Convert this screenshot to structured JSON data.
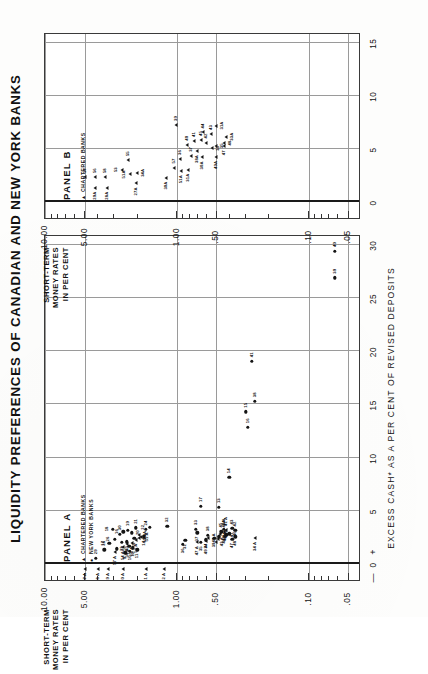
{
  "figure": {
    "title": "LIQUIDITY PREFERENCES OF CANADIAN AND NEW YORK BANKS",
    "y_axis_title_line1": "SHORT-TERM",
    "y_axis_title_line2": "MONEY RATES",
    "y_axis_title_line3": "IN PER CENT",
    "x_axis_title": "EXCESS CASH* AS A PER CENT OF REVISED DEPOSITS",
    "zero_minus": "—",
    "zero_value": "0",
    "zero_plus": "+"
  },
  "chart_data": {
    "type": "scatter",
    "title": "LIQUIDITY PREFERENCES OF CANADIAN AND NEW YORK BANKS",
    "xlabel": "EXCESS CASH* AS A PER CENT OF REVISED DEPOSITS",
    "ylabel": "SHORT-TERM MONEY RATES IN PER CENT",
    "yscale": "log",
    "ylim": [
      0.04,
      10.0
    ],
    "grid": true,
    "legend_position": "inside-top-left",
    "y_ticks": [
      "10.00",
      "5.00",
      "1.00",
      ".50",
      ".10",
      ".05"
    ],
    "y_tick_values": [
      10.0,
      5.0,
      1.0,
      0.5,
      0.1,
      0.05
    ],
    "panels": [
      {
        "name": "PANEL A",
        "label": "PANEL A",
        "xlim": [
          -1.5,
          31
        ],
        "x_ticks": [
          "0",
          "5",
          "10",
          "15",
          "20",
          "25",
          "30"
        ],
        "x_tick_values": [
          0,
          5,
          10,
          15,
          20,
          25,
          30
        ],
        "legend": [
          {
            "symbol": "triangle",
            "label": "CHARTERED BANKS"
          },
          {
            "symbol": "circle",
            "label": "NEW YORK BANKS"
          }
        ],
        "series": [
          {
            "name": "NEW YORK BANKS",
            "marker": "circle",
            "points": [
              {
                "label": "29",
                "x": 0.55,
                "y": 4.1,
                "lp": "r"
              },
              {
                "label": "28",
                "x": 1.35,
                "y": 3.55,
                "lp": "r"
              },
              {
                "label": "27",
                "x": 1.45,
                "y": 2.85,
                "lp": "b"
              },
              {
                "label": "17",
                "x": 1.95,
                "y": 3.25,
                "lp": "t"
              },
              {
                "label": "26",
                "x": 2.35,
                "y": 2.95,
                "lp": "t"
              },
              {
                "label": "30",
                "x": 2.8,
                "y": 2.7,
                "lp": "r"
              },
              {
                "label": "18",
                "x": 3.3,
                "y": 3.05,
                "lp": "t"
              },
              {
                "label": "16",
                "x": 3.05,
                "y": 2.55,
                "lp": "t"
              },
              {
                "label": "19",
                "x": 3.2,
                "y": 2.35,
                "lp": "r"
              },
              {
                "label": "20",
                "x": 2.95,
                "y": 2.2,
                "lp": "b"
              },
              {
                "label": "21",
                "x": 3.4,
                "y": 2.05,
                "lp": "r"
              },
              {
                "label": "15",
                "x": 2.4,
                "y": 2.1,
                "lp": "l"
              },
              {
                "label": "22",
                "x": 3.45,
                "y": 1.6,
                "lp": "t"
              },
              {
                "label": "14",
                "x": 2.55,
                "y": 1.78,
                "lp": "l"
              },
              {
                "label": "25",
                "x": 2.1,
                "y": 2.4,
                "lp": "l"
              },
              {
                "label": "24",
                "x": 3.25,
                "y": 1.72,
                "lp": "r"
              },
              {
                "label": "23",
                "x": 2.05,
                "y": 2.6,
                "lp": "l"
              },
              {
                "label": "13",
                "x": 1.7,
                "y": 2.3,
                "lp": "l"
              },
              {
                "label": "12",
                "x": 1.55,
                "y": 2.15,
                "lp": "l"
              },
              {
                "label": "11",
                "x": 1.35,
                "y": 2.0,
                "lp": "l"
              },
              {
                "label": "10",
                "x": 1.2,
                "y": 2.28,
                "lp": "l"
              },
              {
                "label": "9",
                "x": 1.05,
                "y": 2.45,
                "lp": "l"
              },
              {
                "label": "32",
                "x": 3.55,
                "y": 1.18,
                "lp": "r"
              },
              {
                "label": "33",
                "x": 3.3,
                "y": 0.72,
                "lp": "r"
              },
              {
                "label": "37",
                "x": 2.95,
                "y": 0.7,
                "lp": "l"
              },
              {
                "label": "31",
                "x": 2.25,
                "y": 0.86,
                "lp": "l"
              },
              {
                "label": "36",
                "x": 1.85,
                "y": 0.9,
                "lp": "l"
              },
              {
                "label": "35",
                "x": 2.05,
                "y": 0.66,
                "lp": "l"
              },
              {
                "label": "34",
                "x": 2.3,
                "y": 0.6,
                "lp": "l"
              },
              {
                "label": "38",
                "x": 2.7,
                "y": 0.58,
                "lp": "r"
              },
              {
                "label": "39",
                "x": 2.4,
                "y": 0.52,
                "lp": "l"
              },
              {
                "label": "40",
                "x": 2.55,
                "y": 0.48,
                "lp": "b"
              },
              {
                "label": "45",
                "x": 3.05,
                "y": 0.46,
                "lp": "r"
              },
              {
                "label": "44",
                "x": 3.25,
                "y": 0.44,
                "lp": "r"
              },
              {
                "label": "46",
                "x": 2.85,
                "y": 0.4,
                "lp": "b"
              },
              {
                "label": "43",
                "x": 3.35,
                "y": 0.38,
                "lp": "r"
              },
              {
                "label": "42",
                "x": 3.15,
                "y": 0.36,
                "lp": "r"
              },
              {
                "label": "47",
                "x": 2.35,
                "y": 0.38,
                "lp": "l"
              },
              {
                "label": "48",
                "x": 2.55,
                "y": 0.36,
                "lp": "l"
              },
              {
                "label": "41",
                "x": 2.75,
                "y": 0.42,
                "lp": "b"
              },
              {
                "label": "17",
                "x": 5.45,
                "y": 0.66,
                "lp": "r"
              },
              {
                "label": "13",
                "x": 5.35,
                "y": 0.48,
                "lp": "r"
              },
              {
                "label": "14",
                "x": 8.15,
                "y": 0.4,
                "lp": "r"
              },
              {
                "label": "16",
                "x": 12.85,
                "y": 0.29,
                "lp": "r"
              },
              {
                "label": "15",
                "x": 14.3,
                "y": 0.3,
                "lp": "r"
              },
              {
                "label": "38",
                "x": 15.3,
                "y": 0.255,
                "lp": "r"
              },
              {
                "label": "41",
                "x": 19.05,
                "y": 0.27,
                "lp": "r"
              },
              {
                "label": "39",
                "x": 26.9,
                "y": 0.063,
                "lp": "r"
              },
              {
                "label": "40",
                "x": 29.4,
                "y": 0.063,
                "lp": "r"
              }
            ]
          },
          {
            "name": "CHARTERED BANKS",
            "marker": "triangle",
            "points": [
              {
                "label": "37 A",
                "x": -0.45,
                "y": 4.95,
                "lp": "l"
              },
              {
                "label": "38 A",
                "x": -0.45,
                "y": 3.95,
                "lp": "l"
              },
              {
                "label": "29 A",
                "x": -0.45,
                "y": 3.35,
                "lp": "l"
              },
              {
                "label": "30 A",
                "x": -0.45,
                "y": 2.55,
                "lp": "l"
              },
              {
                "label": "31 A",
                "x": -0.45,
                "y": 1.72,
                "lp": "l"
              },
              {
                "label": "32 A",
                "x": -0.45,
                "y": 1.26,
                "lp": "l"
              },
              {
                "label": "57 A",
                "x": 1.15,
                "y": 2.92,
                "lp": "l"
              },
              {
                "label": "54 A",
                "x": 1.6,
                "y": 2.58,
                "lp": "l"
              },
              {
                "label": "56 A",
                "x": 1.85,
                "y": 2.4,
                "lp": "l"
              },
              {
                "label": "55 A",
                "x": 2.0,
                "y": 2.2,
                "lp": "l"
              },
              {
                "label": "52 A",
                "x": 2.3,
                "y": 2.05,
                "lp": "l"
              },
              {
                "label": "53 A",
                "x": 2.45,
                "y": 1.95,
                "lp": "b"
              },
              {
                "label": "51 A",
                "x": 2.55,
                "y": 1.88,
                "lp": "b"
              },
              {
                "label": "50 A",
                "x": 2.7,
                "y": 1.92,
                "lp": "b"
              },
              {
                "label": "43 A",
                "x": 2.1,
                "y": 0.5,
                "lp": "b"
              },
              {
                "label": "44 A",
                "x": 2.35,
                "y": 0.49,
                "lp": "b"
              },
              {
                "label": "45 A",
                "x": 2.6,
                "y": 0.48,
                "lp": "b"
              },
              {
                "label": "46 A",
                "x": 2.85,
                "y": 0.47,
                "lp": "b"
              },
              {
                "label": "42 A",
                "x": 3.05,
                "y": 0.44,
                "lp": "r"
              },
              {
                "label": "41 A",
                "x": 3.2,
                "y": 0.42,
                "lp": "r"
              },
              {
                "label": "49 A",
                "x": 2.15,
                "y": 0.6,
                "lp": "l"
              },
              {
                "label": "48 A",
                "x": 2.45,
                "y": 0.58,
                "lp": "b"
              },
              {
                "label": "47 A",
                "x": 2.05,
                "y": 0.7,
                "lp": "l"
              },
              {
                "label": "34 A",
                "x": 2.45,
                "y": 0.255,
                "lp": "l"
              }
            ]
          }
        ]
      },
      {
        "name": "PANEL B",
        "label": "PANEL B",
        "xlim": [
          -1.5,
          16
        ],
        "x_ticks": [
          "0",
          "5",
          "10",
          "15"
        ],
        "x_tick_values": [
          0,
          5,
          10,
          15
        ],
        "legend": [
          {
            "symbol": "triangle",
            "label": "CHARTERED BANKS"
          }
        ],
        "series": [
          {
            "name": "CHARTERED BANKS",
            "marker": "triangle",
            "points": [
              {
                "label": "29A",
                "x": 1.35,
                "y": 4.2,
                "lp": "l"
              },
              {
                "label": "57",
                "x": 2.35,
                "y": 4.95,
                "lp": "r"
              },
              {
                "label": "56",
                "x": 2.35,
                "y": 4.2,
                "lp": "r"
              },
              {
                "label": "58",
                "x": 2.35,
                "y": 3.5,
                "lp": "r"
              },
              {
                "label": "28A",
                "x": 1.35,
                "y": 3.4,
                "lp": "l"
              },
              {
                "label": "27A",
                "x": 1.75,
                "y": 2.05,
                "lp": "l"
              },
              {
                "label": "51A",
                "x": 2.6,
                "y": 2.25,
                "lp": "t"
              },
              {
                "label": "53",
                "x": 3.05,
                "y": 2.6,
                "lp": "t"
              },
              {
                "label": "34A",
                "x": 2.75,
                "y": 2.0,
                "lp": "b"
              },
              {
                "label": "55",
                "x": 3.95,
                "y": 2.35,
                "lp": "r"
              },
              {
                "label": "30A",
                "x": 2.3,
                "y": 1.2,
                "lp": "l"
              },
              {
                "label": "57",
                "x": 3.25,
                "y": 1.05,
                "lp": "r"
              },
              {
                "label": "31A",
                "x": 3.05,
                "y": 0.82,
                "lp": "l"
              },
              {
                "label": "51A",
                "x": 2.9,
                "y": 0.93,
                "lp": "l"
              },
              {
                "label": "36",
                "x": 4.05,
                "y": 0.95,
                "lp": "r"
              },
              {
                "label": "37",
                "x": 4.35,
                "y": 0.78,
                "lp": "r"
              },
              {
                "label": "30A",
                "x": 4.2,
                "y": 0.64,
                "lp": "l"
              },
              {
                "label": "38A",
                "x": 4.8,
                "y": 0.7,
                "lp": "l"
              },
              {
                "label": "40",
                "x": 5.4,
                "y": 0.84,
                "lp": "r"
              },
              {
                "label": "41",
                "x": 5.75,
                "y": 0.74,
                "lp": "r"
              },
              {
                "label": "39",
                "x": 7.25,
                "y": 1.02,
                "lp": "r"
              },
              {
                "label": "45",
                "x": 5.85,
                "y": 0.66,
                "lp": "r"
              },
              {
                "label": "42",
                "x": 5.6,
                "y": 0.6,
                "lp": "r"
              },
              {
                "label": "49A",
                "x": 4.25,
                "y": 0.5,
                "lp": "l"
              },
              {
                "label": "33",
                "x": 5.05,
                "y": 0.54,
                "lp": "b"
              },
              {
                "label": "35",
                "x": 5.3,
                "y": 0.5,
                "lp": "b"
              },
              {
                "label": "44",
                "x": 6.55,
                "y": 0.63,
                "lp": "r"
              },
              {
                "label": "43",
                "x": 6.4,
                "y": 0.55,
                "lp": "r"
              },
              {
                "label": "47",
                "x": 5.25,
                "y": 0.44,
                "lp": "l"
              },
              {
                "label": "48",
                "x": 5.55,
                "y": 0.44,
                "lp": "b"
              },
              {
                "label": "33A",
                "x": 6.15,
                "y": 0.42,
                "lp": "b"
              },
              {
                "label": "31A",
                "x": 7.2,
                "y": 0.5,
                "lp": "b"
              }
            ]
          }
        ]
      }
    ]
  }
}
